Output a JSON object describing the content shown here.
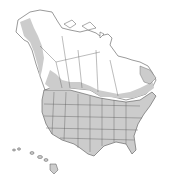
{
  "map": {
    "title": "North America range map",
    "colors": {
      "background": "#ffffff",
      "land": "#ffffff",
      "range": "#cccccc",
      "border": "#555555"
    },
    "regions": [
      {
        "name": "Alaska",
        "shaded": "partial (southern coast)"
      },
      {
        "name": "Canada",
        "shaded": "partial (southern band, Atlantic provinces)"
      },
      {
        "name": "Contiguous United States",
        "shaded": "full"
      },
      {
        "name": "Hawaii",
        "shaded": "full"
      }
    ]
  }
}
